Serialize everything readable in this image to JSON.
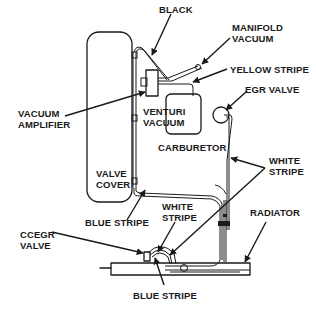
{
  "diagram": {
    "type": "vacuum hose routing schematic",
    "components": [
      {
        "id": "valve-cover",
        "label": "VALVE\nCOVER"
      },
      {
        "id": "carburetor",
        "label": "CARBURETOR"
      },
      {
        "id": "venturi-vacuum",
        "label": "VENTURI\nVACUUM"
      },
      {
        "id": "egr-valve",
        "label": "EGR VALVE"
      },
      {
        "id": "vacuum-amplifier",
        "label": "VACUUM\nAMPLIFIER"
      },
      {
        "id": "ccegr-valve",
        "label": "CCEGR\nVALVE"
      },
      {
        "id": "radiator",
        "label": "RADIATOR"
      },
      {
        "id": "manifold-vacuum",
        "label": "MANIFOLD\nVACUUM"
      }
    ],
    "hose_labels": {
      "black": "BLACK",
      "yellow_stripe": "YELLOW STRIPE",
      "white_stripe_right": "WHITE\nSTRIPE",
      "white_stripe_center": "WHITE\nSTRIPE",
      "blue_stripe_upper": "BLUE STRIPE",
      "blue_stripe_lower": "BLUE STRIPE"
    }
  }
}
